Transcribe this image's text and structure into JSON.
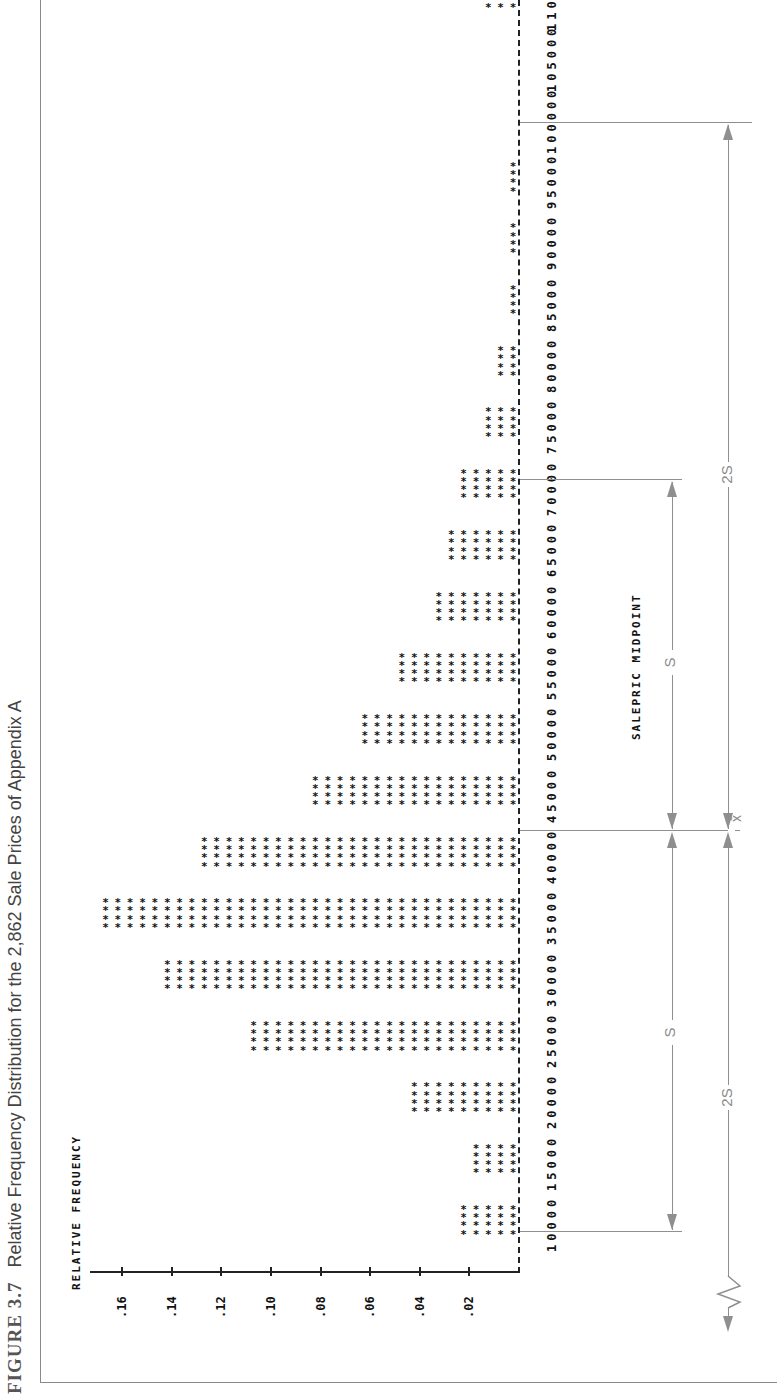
{
  "figure": {
    "number": "FIGURE 3.7",
    "caption": "Relative Frequency Distribution for the 2,862 Sale Prices of Appendix A"
  },
  "chart_data": {
    "type": "bar",
    "orientation": "rotated 90° counter-clockwise (printer histogram, bars of asterisks)",
    "title": "Relative Frequency Distribution for the 2,862 Sale Prices of Appendix A",
    "xlabel": "SALEPRIC MIDPOINT",
    "ylabel": "RELATIVE FREQUENCY",
    "categories": [
      "10000",
      "15000",
      "20000",
      "25000",
      "30000",
      "35000",
      "40000",
      "45000",
      "50000",
      "55000",
      "60000",
      "65000",
      "70000",
      "75000",
      "80000",
      "85000",
      "90000",
      "95000",
      "100000",
      "105000",
      "110000"
    ],
    "values": [
      0.025,
      0.02,
      0.045,
      0.11,
      0.145,
      0.17,
      0.13,
      0.085,
      0.065,
      0.05,
      0.035,
      0.03,
      0.025,
      0.015,
      0.01,
      0.005,
      0.005,
      0.005,
      0.0,
      0.0,
      0.015
    ],
    "y_ticks": [
      ".02",
      ".04",
      ".06",
      ".08",
      ".10",
      ".12",
      ".14",
      ".16"
    ],
    "ylim": [
      0,
      0.17
    ],
    "grid": false,
    "legend": null,
    "annotations": [
      {
        "label": "x̄",
        "at": 40000,
        "note": "mean line"
      },
      {
        "label": "s",
        "from": 15000,
        "to": 40000
      },
      {
        "label": "s",
        "from": 40000,
        "to": 70000
      },
      {
        "label": "2s",
        "from": "below 10000 (axis break)",
        "to": 40000
      },
      {
        "label": "2s",
        "from": 40000,
        "to": 100000
      }
    ]
  },
  "annotation_labels": {
    "mean": "x̄",
    "s": "S",
    "two_s": "2S"
  }
}
